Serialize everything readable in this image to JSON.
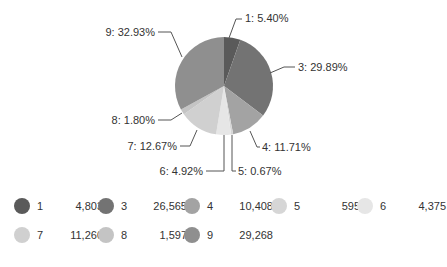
{
  "chart_data": {
    "type": "pie",
    "title": "",
    "categories": [
      "1",
      "3",
      "4",
      "5",
      "6",
      "7",
      "8",
      "9"
    ],
    "values": [
      4803,
      26565,
      10408,
      595,
      4375,
      11260,
      1597,
      29268
    ],
    "percent_labels": [
      "1: 5.40%",
      "3: 29.89%",
      "4: 11.71%",
      "5: 0.67%",
      "6: 4.92%",
      "7: 12.67%",
      "8: 1.80%",
      "9: 32.93%"
    ],
    "colors": [
      "#5a5a5a",
      "#737373",
      "#a3a3a3",
      "#d6d6d6",
      "#e6e6e6",
      "#d0d0d0",
      "#c4c4c4",
      "#8f8f8f"
    ],
    "legend_position": "bottom",
    "legend": [
      {
        "key": "1",
        "value": "4,803"
      },
      {
        "key": "3",
        "value": "26,565"
      },
      {
        "key": "4",
        "value": "10,408"
      },
      {
        "key": "5",
        "value": "595"
      },
      {
        "key": "6",
        "value": "4,375"
      },
      {
        "key": "7",
        "value": "11,260"
      },
      {
        "key": "8",
        "value": "1,597"
      },
      {
        "key": "9",
        "value": "29,268"
      }
    ]
  }
}
